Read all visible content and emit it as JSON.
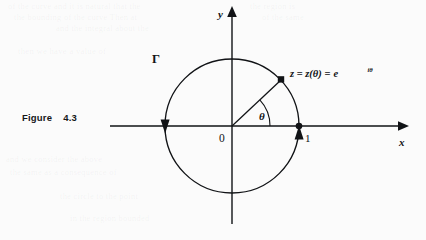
{
  "figure": {
    "caption_label": "Figure",
    "caption_number": "4.3"
  },
  "diagram": {
    "type": "unit-circle-complex-plane",
    "background_color": "#fbfbfb",
    "ink_color": "#111316",
    "axes": {
      "x_label": "x",
      "y_label": "y",
      "origin_label": "0",
      "x_axis_y_px": 126,
      "y_axis_x_px": 232,
      "x_axis_start_px": 110,
      "x_axis_end_px": 404,
      "y_axis_start_px": 14,
      "y_axis_end_px": 224
    },
    "circle": {
      "curve_label": "Γ",
      "center_x_px": 232,
      "center_y_px": 126,
      "radius_px": 67,
      "orientation": "counterclockwise",
      "direction_arrow_left_label": "down-arrowhead",
      "direction_arrow_right_label": "up-arrowhead"
    },
    "point_on_axis": {
      "label": "1",
      "x_px": 299,
      "y_px": 126
    },
    "point_z": {
      "label_parts": {
        "z": "z",
        "equals_1": "=",
        "z_of_theta": "z(θ)",
        "equals_2": "=",
        "e": "e",
        "exponent": "iθ"
      },
      "label_full": "z = z(θ) = e^{iθ}",
      "angle_degrees": 43,
      "x_px": 281,
      "y_px": 80
    },
    "angle": {
      "label": "θ",
      "arc_radius_px": 38,
      "from_degrees": 0,
      "to_degrees": 43
    }
  }
}
